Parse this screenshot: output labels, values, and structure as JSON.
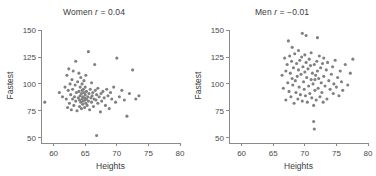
{
  "figure": {
    "background_color": "#ffffff",
    "point_color": "#808080",
    "axis_color": "#8a8a8a",
    "text_color": "#3b3b3b"
  },
  "panels": {
    "women": {
      "title_prefix": "Women ",
      "title_r_symbol": "r",
      "title_value": " = 0.04"
    },
    "men": {
      "title_prefix": "Men ",
      "title_r_symbol": "r",
      "title_value": " = −0.01"
    }
  },
  "chart_data": [
    {
      "type": "scatter",
      "title": "Women r = 0.04",
      "xlabel": "Heights",
      "ylabel": "Fastest",
      "xlim": [
        58,
        80
      ],
      "ylim": [
        45,
        152
      ],
      "xticks": [
        60,
        65,
        70,
        75,
        80
      ],
      "yticks": [
        50,
        75,
        100,
        125,
        150
      ],
      "xtick_labels": [
        "60",
        "65",
        "70",
        "75",
        "80"
      ],
      "ytick_labels": [
        "50",
        "75",
        "100",
        "125",
        "150"
      ],
      "grid": false,
      "legend": false,
      "correlation": 0.04,
      "n_points": 98,
      "marker_color": "#808080",
      "marker_size": 3.1,
      "x": [
        58.6,
        60.9,
        61.4,
        61.8,
        62.0,
        62.1,
        62.2,
        62.3,
        62.4,
        62.5,
        62.6,
        62.7,
        62.8,
        62.9,
        63.0,
        63.0,
        63.1,
        63.2,
        63.3,
        63.4,
        63.5,
        63.5,
        63.6,
        63.7,
        63.8,
        63.9,
        64.0,
        64.0,
        64.1,
        64.1,
        64.2,
        64.2,
        64.3,
        64.3,
        64.4,
        64.4,
        64.5,
        64.5,
        64.5,
        64.6,
        64.6,
        64.7,
        64.7,
        64.8,
        64.8,
        64.9,
        64.9,
        65.0,
        65.0,
        65.0,
        65.1,
        65.1,
        65.2,
        65.2,
        65.3,
        65.4,
        65.5,
        65.5,
        65.6,
        65.7,
        65.8,
        65.9,
        66.0,
        66.0,
        66.1,
        66.2,
        66.3,
        66.4,
        66.5,
        66.6,
        66.7,
        66.8,
        67.0,
        67.0,
        67.2,
        67.4,
        67.5,
        67.6,
        67.8,
        68.0,
        68.2,
        68.4,
        68.6,
        68.8,
        69.0,
        69.2,
        69.5,
        69.8,
        70.0,
        70.4,
        70.8,
        71.2,
        71.6,
        72.0,
        72.5,
        73.0,
        73.5,
        66.8
      ],
      "y": [
        83,
        92,
        88,
        97,
        86,
        108,
        78,
        94,
        114,
        82,
        100,
        90,
        76,
        104,
        86,
        95,
        112,
        80,
        88,
        99,
        84,
        121,
        92,
        75,
        102,
        87,
        93,
        110,
        79,
        85,
        97,
        89,
        83,
        106,
        91,
        77,
        86,
        94,
        100,
        81,
        88,
        95,
        84,
        92,
        103,
        87,
        78,
        85,
        90,
        97,
        82,
        108,
        86,
        93,
        80,
        88,
        84,
        130,
        91,
        76,
        95,
        87,
        83,
        101,
        89,
        92,
        79,
        86,
        118,
        94,
        85,
        90,
        82,
        96,
        88,
        74,
        91,
        84,
        93,
        87,
        80,
        95,
        89,
        77,
        92,
        86,
        97,
        83,
        124,
        88,
        94,
        85,
        70,
        91,
        113,
        86,
        89,
        52
      ]
    },
    {
      "type": "scatter",
      "title": "Men r = −0.01",
      "xlabel": "Heights",
      "ylabel": "Fastest",
      "xlim": [
        58,
        80
      ],
      "ylim": [
        45,
        152
      ],
      "xticks": [
        60,
        65,
        70,
        75,
        80
      ],
      "yticks": [
        50,
        75,
        100,
        125,
        150
      ],
      "xtick_labels": [
        "60",
        "65",
        "70",
        "75",
        "80"
      ],
      "ytick_labels": [
        "50",
        "75",
        "100",
        "125",
        "150"
      ],
      "grid": false,
      "legend": false,
      "correlation": -0.01,
      "n_points": 96,
      "marker_color": "#808080",
      "marker_size": 3.1,
      "x": [
        66.4,
        66.6,
        66.8,
        67.0,
        67.0,
        67.2,
        67.3,
        67.4,
        67.5,
        67.6,
        67.7,
        67.8,
        67.9,
        68.0,
        68.0,
        68.1,
        68.2,
        68.3,
        68.4,
        68.5,
        68.6,
        68.7,
        68.8,
        68.9,
        69.0,
        69.0,
        69.1,
        69.2,
        69.3,
        69.4,
        69.5,
        69.6,
        69.7,
        69.8,
        69.9,
        70.0,
        70.0,
        70.1,
        70.2,
        70.3,
        70.4,
        70.5,
        70.6,
        70.7,
        70.8,
        70.9,
        71.0,
        71.0,
        71.1,
        71.2,
        71.3,
        71.4,
        71.5,
        71.6,
        71.7,
        71.8,
        71.9,
        72.0,
        72.0,
        72.1,
        72.2,
        72.3,
        72.4,
        72.5,
        72.6,
        72.7,
        72.8,
        72.9,
        73.0,
        73.0,
        73.2,
        73.4,
        73.5,
        73.6,
        73.8,
        74.0,
        74.2,
        74.4,
        74.5,
        74.6,
        74.8,
        75.0,
        75.2,
        75.4,
        75.6,
        75.8,
        76.0,
        76.4,
        76.8,
        77.2,
        77.6,
        69.6,
        70.2,
        71.4,
        71.5,
        71.6
      ],
      "y": [
        108,
        96,
        124,
        112,
        85,
        118,
        101,
        140,
        93,
        126,
        110,
        88,
        121,
        105,
        134,
        99,
        115,
        82,
        128,
        103,
        92,
        119,
        107,
        86,
        113,
        131,
        97,
        122,
        90,
        109,
        125,
        84,
        116,
        102,
        95,
        111,
        127,
        89,
        120,
        106,
        83,
        114,
        98,
        123,
        91,
        117,
        104,
        129,
        87,
        110,
        100,
        80,
        118,
        94,
        108,
        85,
        121,
        112,
        143,
        96,
        105,
        126,
        88,
        115,
        101,
        92,
        119,
        83,
        107,
        124,
        98,
        113,
        86,
        120,
        103,
        95,
        109,
        116,
        91,
        100,
        122,
        97,
        106,
        89,
        112,
        102,
        94,
        118,
        99,
        110,
        123,
        147,
        145,
        65,
        58,
        104
      ]
    }
  ]
}
